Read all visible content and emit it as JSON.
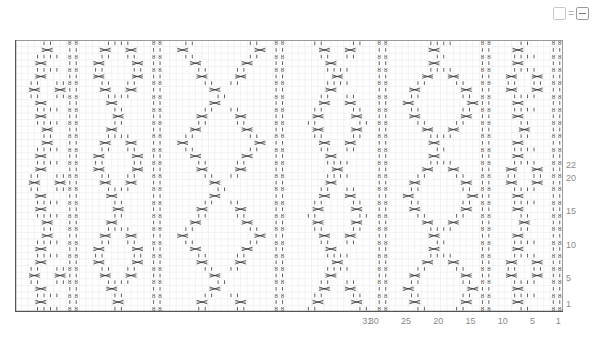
{
  "toolbar": {
    "view_toggle_left_label": "",
    "equals_label": "=",
    "view_toggle_right_label": "−"
  },
  "chart_data": {
    "type": "table",
    "columns": 85,
    "rows": 41,
    "grid": true,
    "row_tick_labels": [
      {
        "row": 1,
        "label": "1"
      },
      {
        "row": 5,
        "label": "5"
      },
      {
        "row": 10,
        "label": "10"
      },
      {
        "row": 15,
        "label": "15"
      },
      {
        "row": 20,
        "label": "20"
      },
      {
        "row": 22,
        "label": "22"
      }
    ],
    "column_tick_labels": [
      {
        "col": 1,
        "label": "1"
      },
      {
        "col": 5,
        "label": "5"
      },
      {
        "col": 10,
        "label": "10"
      },
      {
        "col": 15,
        "label": "15"
      },
      {
        "col": 20,
        "label": "20"
      },
      {
        "col": 25,
        "label": "25"
      },
      {
        "col": 30,
        "label": "30"
      },
      {
        "col": 31,
        "label": "31"
      }
    ],
    "twisted_rib_columns_from_left": [
      9,
      22,
      41,
      57,
      73,
      84
    ],
    "cable_panels": [
      {
        "left": 2,
        "width": 6,
        "type": "diamond"
      },
      {
        "left": 12,
        "width": 8,
        "type": "diamond"
      },
      {
        "left": 25,
        "width": 14,
        "type": "diamond"
      },
      {
        "left": 45,
        "width": 10,
        "type": "diamond"
      },
      {
        "left": 60,
        "width": 12,
        "type": "diamond"
      },
      {
        "left": 76,
        "width": 6,
        "type": "diamond"
      }
    ],
    "symbol_legend": {
      "knit_tbl": "twisted stitch (ՁՁ)",
      "knit": "knit (|)",
      "cross": "cable crossing (><)"
    },
    "colors": {
      "grid": "#e6e6e6",
      "border": "#9a9a9a",
      "symbol": "#333333",
      "label": "#8a8a8a"
    }
  }
}
